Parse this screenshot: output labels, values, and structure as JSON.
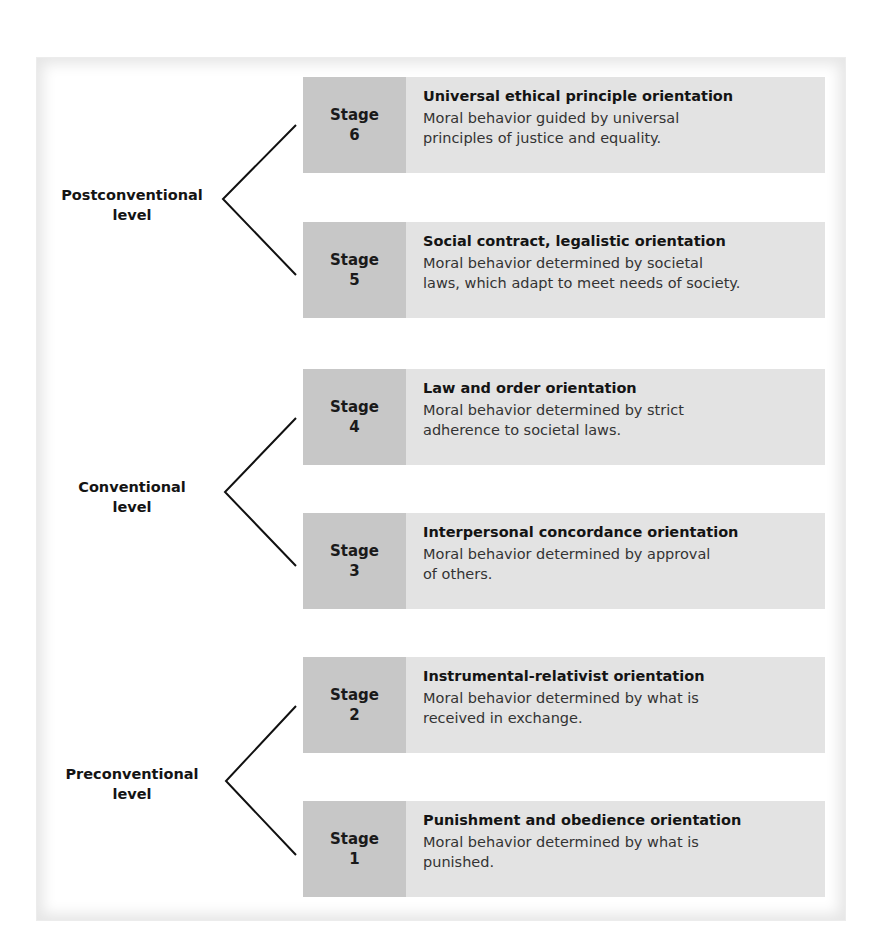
{
  "diagram": {
    "colors": {
      "stage_number_bg": "#c7c7c7",
      "stage_text_bg": "#e3e3e3",
      "frame_shadow": "#e6e6e6",
      "line": "#111111"
    },
    "levels": [
      {
        "line1": "Postconventional",
        "line2": "level",
        "stages": [
          {
            "label": "Stage",
            "number": "6",
            "title": "Universal ethical principle orientation",
            "desc_line1": "Moral behavior guided by universal",
            "desc_line2": "principles of justice and equality."
          },
          {
            "label": "Stage",
            "number": "5",
            "title": "Social contract, legalistic orientation",
            "desc_line1": "Moral behavior determined by societal",
            "desc_line2": "laws, which adapt to meet needs of society."
          }
        ]
      },
      {
        "line1": "Conventional",
        "line2": "level",
        "stages": [
          {
            "label": "Stage",
            "number": "4",
            "title": "Law and order orientation",
            "desc_line1": "Moral behavior determined by strict",
            "desc_line2": "adherence to societal laws."
          },
          {
            "label": "Stage",
            "number": "3",
            "title": "Interpersonal concordance orientation",
            "desc_line1": "Moral behavior determined by approval",
            "desc_line2": "of others."
          }
        ]
      },
      {
        "line1": "Preconventional",
        "line2": "level",
        "stages": [
          {
            "label": "Stage",
            "number": "2",
            "title": "Instrumental-relativist orientation",
            "desc_line1": "Moral behavior determined by what is",
            "desc_line2": "received in exchange."
          },
          {
            "label": "Stage",
            "number": "1",
            "title": "Punishment and obedience orientation",
            "desc_line1": "Moral behavior determined by what is",
            "desc_line2": "punished."
          }
        ]
      }
    ]
  }
}
